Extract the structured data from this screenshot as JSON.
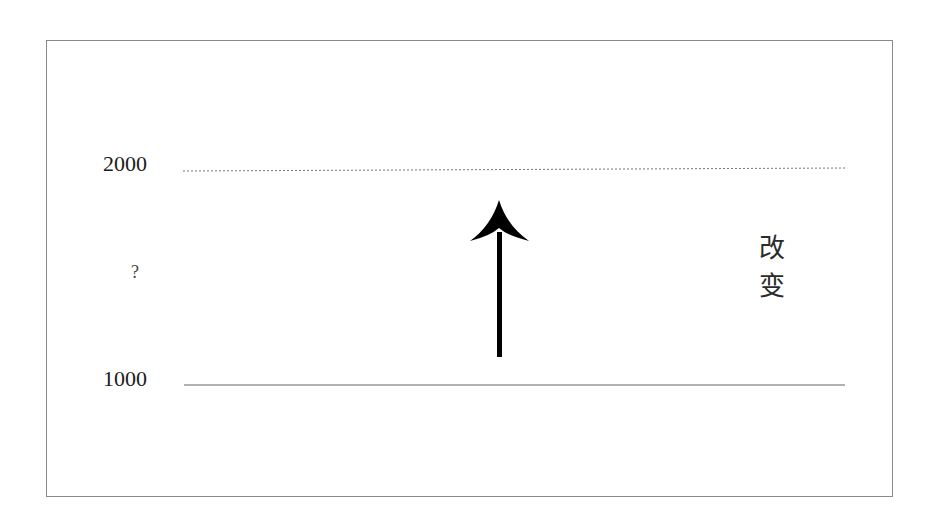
{
  "diagram": {
    "upper_level_label": "2000",
    "lower_level_label": "1000",
    "unknown_label": "?",
    "change_label_chars": [
      "改",
      "变"
    ],
    "colors": {
      "frame": "#8a8a8a",
      "upper_line": "#777777",
      "lower_line": "#666666",
      "arrow": "#000000",
      "text": "#1a1a1a"
    }
  }
}
